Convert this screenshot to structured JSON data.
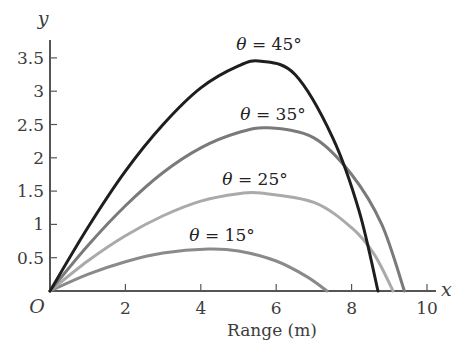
{
  "chart_data": {
    "type": "line",
    "title": "",
    "xlabel": "Range (m)",
    "ylabel": "y",
    "x_axis_letter": "x",
    "origin_label": "O",
    "xlim": [
      0,
      10
    ],
    "ylim": [
      0,
      3.7
    ],
    "x_ticks": [
      2,
      4,
      6,
      8,
      10
    ],
    "x_tick_labels": [
      "2",
      "4",
      "6",
      "8",
      "10"
    ],
    "y_ticks": [
      0.5,
      1,
      1.5,
      2,
      2.5,
      3,
      3.5
    ],
    "y_tick_labels": [
      "0.5",
      "1",
      "1.5",
      "2",
      "2.5",
      "3",
      "3.5"
    ],
    "grid": false,
    "legend": "inline labels above each curve",
    "series": [
      {
        "name": "θ = 45°",
        "label": "θ = 45°",
        "color": "#1e1e1e",
        "range": 8.7,
        "max_height": 3.45,
        "peak_x": 5.6,
        "x": [
          0,
          1,
          2,
          3,
          4,
          5,
          5.6,
          6.5,
          7.5,
          8.2,
          8.7
        ],
        "y": [
          0,
          0.95,
          1.8,
          2.5,
          3.05,
          3.38,
          3.45,
          3.25,
          2.3,
          1.2,
          0
        ]
      },
      {
        "name": "θ = 35°",
        "label": "θ = 35°",
        "color": "#7a7a7a",
        "range": 9.4,
        "max_height": 2.45,
        "peak_x": 5.8,
        "x": [
          0,
          1,
          2,
          3,
          4,
          5,
          5.8,
          7,
          8,
          8.8,
          9.4
        ],
        "y": [
          0,
          0.68,
          1.28,
          1.78,
          2.15,
          2.38,
          2.45,
          2.3,
          1.75,
          1.0,
          0
        ]
      },
      {
        "name": "θ = 25°",
        "label": "θ = 25°",
        "color": "#aaaaaa",
        "range": 9.1,
        "max_height": 1.47,
        "peak_x": 5.6,
        "x": [
          0,
          1,
          2,
          3,
          4,
          5,
          5.6,
          7,
          8,
          8.6,
          9.1
        ],
        "y": [
          0,
          0.45,
          0.83,
          1.13,
          1.35,
          1.46,
          1.47,
          1.33,
          0.95,
          0.55,
          0
        ]
      },
      {
        "name": "θ = 15°",
        "label": "θ = 15°",
        "color": "#8a8a8a",
        "range": 7.35,
        "max_height": 0.63,
        "peak_x": 4.2,
        "x": [
          0,
          1,
          2,
          3,
          4.2,
          5,
          6,
          6.8,
          7.35
        ],
        "y": [
          0,
          0.25,
          0.44,
          0.57,
          0.63,
          0.6,
          0.45,
          0.22,
          0
        ]
      }
    ]
  }
}
